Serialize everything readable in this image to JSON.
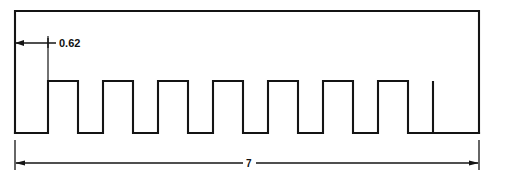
{
  "drawing": {
    "title": "Rack tooth profile cross-section",
    "background_color": "#ffffff",
    "line_color": "#141414",
    "dimensions": {
      "pitch": {
        "value": "0.62",
        "label_name": "pitch-dimension-label"
      },
      "overall_length": {
        "value": "7",
        "label_name": "overall-length-dimension-label"
      }
    },
    "geometry": {
      "tooth_count": 7,
      "outline_left_x": 15,
      "outline_right_x": 479,
      "outline_top_y": 11,
      "baseline_y": 133,
      "tooth_top_y": 81,
      "tooth_width": 30,
      "tooth_pitch": 55,
      "first_tooth_left_x": 48,
      "pitch_dim_line_y": 43,
      "length_dim_line_y": 163
    }
  }
}
